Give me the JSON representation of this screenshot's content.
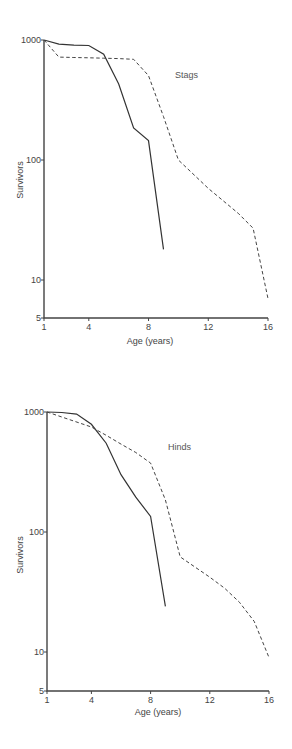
{
  "chart_data": [
    {
      "type": "line",
      "title": "Stags",
      "xlabel": "Age (years)",
      "ylabel": "Survivors",
      "yscale": "log",
      "xlim": [
        1,
        16
      ],
      "ylim": [
        5,
        1000
      ],
      "xticks": [
        1,
        4,
        8,
        12,
        16
      ],
      "yticks": [
        5,
        10,
        100,
        1000
      ],
      "ytick_labels": [
        "5",
        "10",
        "100",
        "1000"
      ],
      "grid": false,
      "legend": null,
      "series": [
        {
          "name": "solid",
          "style": "solid",
          "x": [
            1,
            2,
            3,
            4,
            5,
            6,
            7,
            8,
            9
          ],
          "y": [
            1000,
            925,
            905,
            900,
            760,
            430,
            185,
            145,
            18
          ]
        },
        {
          "name": "dashed",
          "style": "dashed",
          "x": [
            1,
            2,
            3,
            4,
            5,
            6,
            7,
            8,
            9,
            10,
            12,
            14,
            15,
            16
          ],
          "y": [
            1000,
            720,
            715,
            710,
            705,
            700,
            690,
            505,
            230,
            100,
            58,
            36,
            27,
            7
          ]
        }
      ]
    },
    {
      "type": "line",
      "title": "Hinds",
      "xlabel": "Age (years)",
      "ylabel": "Survivors",
      "yscale": "log",
      "xlim": [
        1,
        16
      ],
      "ylim": [
        5,
        1000
      ],
      "xticks": [
        1,
        4,
        8,
        12,
        16
      ],
      "yticks": [
        5,
        10,
        100,
        1000
      ],
      "ytick_labels": [
        "5",
        "10",
        "100",
        "1000"
      ],
      "grid": false,
      "legend": null,
      "series": [
        {
          "name": "solid",
          "style": "solid",
          "x": [
            1,
            2,
            3,
            4,
            5,
            6,
            7,
            8,
            9
          ],
          "y": [
            1000,
            990,
            960,
            790,
            550,
            300,
            195,
            135,
            24
          ]
        },
        {
          "name": "dashed",
          "style": "dashed",
          "x": [
            1,
            4,
            5,
            6,
            7,
            8,
            9,
            10,
            12,
            13,
            14,
            15,
            16
          ],
          "y": [
            1000,
            750,
            640,
            540,
            460,
            375,
            185,
            62,
            42,
            34,
            26,
            18,
            9
          ]
        }
      ]
    }
  ],
  "panels": [
    {
      "label": "Stags",
      "xlabel": "Age (years)",
      "ylabel": "Survivors",
      "layout": {
        "x0": 44,
        "x16": 268,
        "y1000": 40,
        "y100": 160,
        "yBottom": 318,
        "labelX": 175,
        "labelY": 78
      }
    },
    {
      "label": "Hinds",
      "xlabel": "Age (years)",
      "ylabel": "Survivors",
      "layout": {
        "x0": 47,
        "x16": 269,
        "y1000": 412,
        "y100": 532,
        "yBottom": 691,
        "labelX": 168,
        "labelY": 450
      }
    }
  ]
}
